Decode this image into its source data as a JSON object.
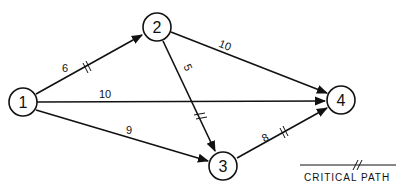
{
  "diagram": {
    "type": "network-activity-diagram",
    "stroke_color": "#111111",
    "background": "#ffffff",
    "nodes": [
      {
        "id": "1",
        "label": "1",
        "x": 23,
        "y": 102
      },
      {
        "id": "2",
        "label": "2",
        "x": 157,
        "y": 27
      },
      {
        "id": "3",
        "label": "3",
        "x": 223,
        "y": 166
      },
      {
        "id": "4",
        "label": "4",
        "x": 341,
        "y": 100
      }
    ],
    "edges": [
      {
        "from": "1",
        "to": "2",
        "weight": "6",
        "critical": true
      },
      {
        "from": "1",
        "to": "4",
        "weight": "10",
        "critical": false
      },
      {
        "from": "1",
        "to": "3",
        "weight": "9",
        "critical": false
      },
      {
        "from": "2",
        "to": "4",
        "weight": "10",
        "critical": false
      },
      {
        "from": "2",
        "to": "3",
        "weight": "5",
        "critical": true
      },
      {
        "from": "3",
        "to": "4",
        "weight": "8",
        "critical": true
      }
    ],
    "legend": {
      "label": "CRITICAL PATH",
      "symbol": "//"
    }
  }
}
